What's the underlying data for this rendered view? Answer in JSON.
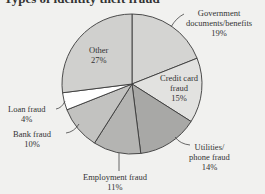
{
  "chart_data": {
    "type": "pie",
    "title": "Types of identity theft fraud",
    "categories": [
      "Government documents/benefits",
      "Credit card fraud",
      "Utilities/phone fraud",
      "Employment fraud",
      "Bank fraud",
      "Loan fraud",
      "Other"
    ],
    "values": [
      19,
      15,
      14,
      11,
      10,
      4,
      27
    ],
    "unit": "%",
    "colors": [
      "#d4d4d2",
      "#e2e2e0",
      "#a8a8a6",
      "#b4b4b2",
      "#c2c2c0",
      "#ffffff",
      "#d0d0ce"
    ],
    "start_angle": "12 o'clock",
    "direction": "clockwise"
  },
  "labels": {
    "government": {
      "line1": "Government",
      "line2": "documents/benefits",
      "pct": "19%"
    },
    "credit": {
      "line1": "Credit card",
      "line2": "fraud",
      "pct": "15%"
    },
    "utilities": {
      "line1": "Utilities/",
      "line2": "phone fraud",
      "pct": "14%"
    },
    "employment": {
      "line1": "Employment fraud",
      "pct": "11%"
    },
    "bank": {
      "line1": "Bank fraud",
      "pct": "10%"
    },
    "loan": {
      "line1": "Loan fraud",
      "pct": "4%"
    },
    "other": {
      "line1": "Other",
      "pct": "27%"
    }
  }
}
